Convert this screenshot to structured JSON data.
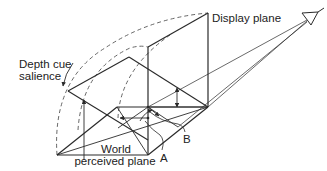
{
  "figure": {
    "labels": {
      "display_plane": "Display plane",
      "depth_cue_line1": "Depth cue",
      "depth_cue_line2": "salience",
      "world_line1": "World",
      "world_line2": "perceived plane",
      "point_a": "A",
      "point_b": "B"
    },
    "icons": {
      "viewer": "eye-icon"
    },
    "colors": {
      "line": "#2a2a2a",
      "dashed": "#555555",
      "text": "#222222",
      "background": "#ffffff"
    }
  }
}
